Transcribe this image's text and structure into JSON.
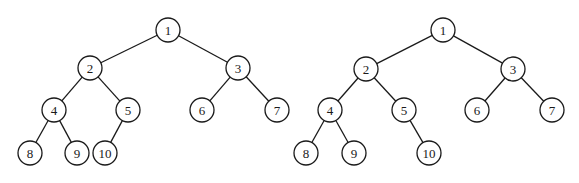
{
  "diagram": {
    "node_radius": 12,
    "stroke_color": "#1a1a1a",
    "trees": [
      {
        "id": "tree-left",
        "nodes": [
          {
            "id": "1",
            "label": "1",
            "x": 168,
            "y": 30
          },
          {
            "id": "2",
            "label": "2",
            "x": 90,
            "y": 68
          },
          {
            "id": "3",
            "label": "3",
            "x": 238,
            "y": 68
          },
          {
            "id": "4",
            "label": "4",
            "x": 54,
            "y": 110
          },
          {
            "id": "5",
            "label": "5",
            "x": 128,
            "y": 110
          },
          {
            "id": "6",
            "label": "6",
            "x": 202,
            "y": 110
          },
          {
            "id": "7",
            "label": "7",
            "x": 277,
            "y": 110
          },
          {
            "id": "8",
            "label": "8",
            "x": 30,
            "y": 153
          },
          {
            "id": "9",
            "label": "9",
            "x": 77,
            "y": 153
          },
          {
            "id": "10",
            "label": "10",
            "x": 105,
            "y": 153
          }
        ],
        "edges": [
          [
            "1",
            "2"
          ],
          [
            "1",
            "3"
          ],
          [
            "2",
            "4"
          ],
          [
            "2",
            "5"
          ],
          [
            "3",
            "6"
          ],
          [
            "3",
            "7"
          ],
          [
            "4",
            "8"
          ],
          [
            "4",
            "9"
          ],
          [
            "5",
            "10"
          ]
        ]
      },
      {
        "id": "tree-right",
        "nodes": [
          {
            "id": "1",
            "label": "1",
            "x": 443,
            "y": 30
          },
          {
            "id": "2",
            "label": "2",
            "x": 366,
            "y": 69
          },
          {
            "id": "3",
            "label": "3",
            "x": 513,
            "y": 69
          },
          {
            "id": "4",
            "label": "4",
            "x": 330,
            "y": 110
          },
          {
            "id": "5",
            "label": "5",
            "x": 404,
            "y": 110
          },
          {
            "id": "6",
            "label": "6",
            "x": 477,
            "y": 110
          },
          {
            "id": "7",
            "label": "7",
            "x": 552,
            "y": 110
          },
          {
            "id": "8",
            "label": "8",
            "x": 306,
            "y": 153
          },
          {
            "id": "9",
            "label": "9",
            "x": 354,
            "y": 153
          },
          {
            "id": "10",
            "label": "10",
            "x": 429,
            "y": 153
          }
        ],
        "edges": [
          [
            "1",
            "2"
          ],
          [
            "1",
            "3"
          ],
          [
            "2",
            "4"
          ],
          [
            "2",
            "5"
          ],
          [
            "3",
            "6"
          ],
          [
            "3",
            "7"
          ],
          [
            "4",
            "8"
          ],
          [
            "4",
            "9"
          ],
          [
            "5",
            "10"
          ]
        ]
      }
    ]
  }
}
